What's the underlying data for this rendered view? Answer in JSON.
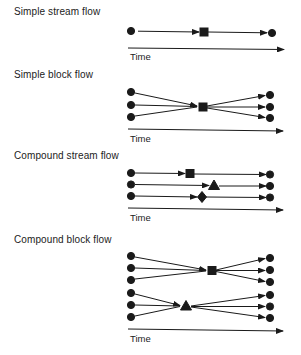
{
  "panels": [
    {
      "title": "Simple stream flow",
      "time_label": "Time"
    },
    {
      "title": "Simple block flow",
      "time_label": "Time"
    },
    {
      "title": "Compound stream flow",
      "time_label": "Time"
    },
    {
      "title": "Compound block flow",
      "time_label": "Time"
    }
  ],
  "legend_symbols": {
    "source": "circle",
    "operation_1": "square",
    "operation_2": "triangle",
    "operation_3": "diamond"
  },
  "colors": {
    "ink": "#1a1a1a",
    "background": "#ffffff"
  }
}
